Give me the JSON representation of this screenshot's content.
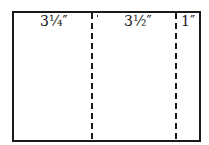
{
  "diagram": {
    "type": "panel-fold-layout",
    "panels": [
      {
        "label": "3¼″"
      },
      {
        "label": "3½″"
      },
      {
        "label": "1″"
      }
    ],
    "fold_lines": 2,
    "colors": {
      "stroke": "#1a1a1a",
      "background": "#ffffff"
    }
  }
}
